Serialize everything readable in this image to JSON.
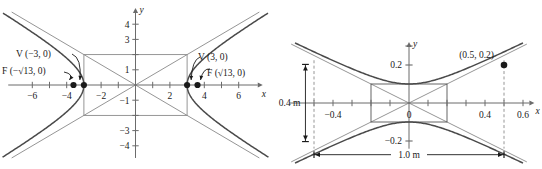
{
  "figure_left": {
    "name": "hyperbola-horizontal-transverse",
    "axis_labels": {
      "x": "x",
      "y": "y"
    },
    "x_ticks": [
      {
        "value": -6,
        "label": "−6"
      },
      {
        "value": -5,
        "label": ""
      },
      {
        "value": -4,
        "label": "−4"
      },
      {
        "value": -3,
        "label": ""
      },
      {
        "value": -2,
        "label": "−2"
      },
      {
        "value": -1,
        "label": ""
      },
      {
        "value": 1,
        "label": ""
      },
      {
        "value": 2,
        "label": "2"
      },
      {
        "value": 3,
        "label": ""
      },
      {
        "value": 4,
        "label": "4"
      },
      {
        "value": 5,
        "label": ""
      },
      {
        "value": 6,
        "label": "6"
      }
    ],
    "y_ticks": [
      {
        "value": 4,
        "label": "4"
      },
      {
        "value": 3,
        "label": "3"
      },
      {
        "value": 2,
        "label": ""
      },
      {
        "value": 1,
        "label": "1"
      },
      {
        "value": -1,
        "label": "−1"
      },
      {
        "value": -2,
        "label": ""
      },
      {
        "value": -3,
        "label": "−3"
      },
      {
        "value": -4,
        "label": "−4"
      }
    ],
    "annotations": [
      {
        "id": "vertex-left",
        "text": "V (−3, 0)",
        "target": "vertex at x = -3"
      },
      {
        "id": "focus-left",
        "text": "F (−√13, 0)",
        "target": "focus at x = -√13"
      },
      {
        "id": "vertex-right",
        "text": "V (3, 0)",
        "target": "vertex at x = 3"
      },
      {
        "id": "focus-right",
        "text": "F (√13, 0)",
        "target": "focus at x = √13"
      }
    ],
    "points": [
      {
        "label": "V (−3, 0)",
        "x": -3,
        "y": 0
      },
      {
        "label": "F (−√13, 0)",
        "x": -3.6056,
        "y": 0
      },
      {
        "label": "V (3, 0)",
        "x": 3,
        "y": 0
      },
      {
        "label": "F (√13, 0)",
        "x": 3.6056,
        "y": 0
      }
    ],
    "central_rectangle": {
      "x_half_width": 3,
      "y_half_height": 2
    },
    "hyperbola": {
      "a": 3,
      "b": 2,
      "orientation": "horizontal"
    },
    "xlim": [
      -7.4,
      7.4
    ],
    "ylim": [
      -4.8,
      4.8
    ]
  },
  "figure_right": {
    "name": "hyperbola-vertical-transverse-dimensioned",
    "axis_labels": {
      "x": "x",
      "y": "y"
    },
    "x_ticks": [
      {
        "value": -0.5,
        "label": ""
      },
      {
        "value": -0.4,
        "label": "−0.4"
      },
      {
        "value": -0.3,
        "label": ""
      },
      {
        "value": -0.2,
        "label": ""
      },
      {
        "value": -0.1,
        "label": ""
      },
      {
        "value": 0,
        "label": "0"
      },
      {
        "value": 0.1,
        "label": ""
      },
      {
        "value": 0.2,
        "label": ""
      },
      {
        "value": 0.3,
        "label": ""
      },
      {
        "value": 0.4,
        "label": "0.4"
      },
      {
        "value": 0.5,
        "label": ""
      },
      {
        "value": 0.6,
        "label": "0.6"
      }
    ],
    "y_ticks": [
      {
        "value": 0.3,
        "label": ""
      },
      {
        "value": 0.2,
        "label": "0.2"
      },
      {
        "value": -0.2,
        "label": "−0.2"
      }
    ],
    "points": [
      {
        "label": "(0.5, 0.2)",
        "x": 0.5,
        "y": 0.2
      }
    ],
    "dimensions": [
      {
        "id": "height-dim",
        "label": "0.4 m",
        "orientation": "vertical",
        "value": 0.4
      },
      {
        "id": "width-dim",
        "label": "1.0 m",
        "orientation": "horizontal",
        "value": 1.0
      }
    ],
    "central_rectangle": {
      "x_half_width": 0.2,
      "y_half_height": 0.1
    },
    "hyperbola": {
      "a": 0.1,
      "b": 0.2,
      "orientation": "vertical"
    },
    "xlim": [
      -0.68,
      0.68
    ],
    "ylim": [
      -0.31,
      0.31
    ]
  },
  "colors": {
    "curve": "#4a4a4a",
    "axis": "#6b6b6b",
    "rectangle": "#8a8a8a",
    "asymptote": "#7a7a7a",
    "point": "#1a1a1a",
    "text": "#1a1a1a",
    "dashed": "#8a8a8a"
  }
}
